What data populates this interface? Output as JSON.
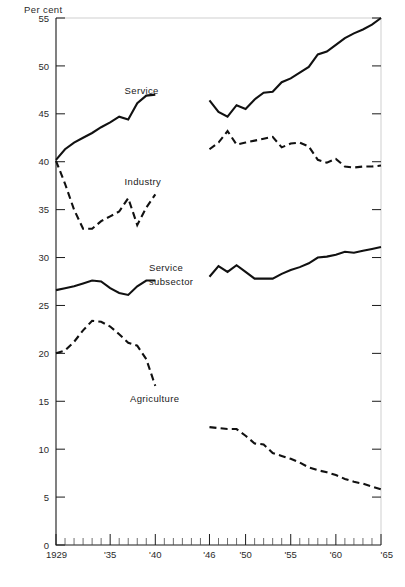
{
  "chart_data": {
    "type": "line",
    "title": "",
    "subtitle": "",
    "xlabel": "",
    "ylabel": "Per cent",
    "ylim": [
      0,
      55
    ],
    "xlim": [
      1929,
      1965
    ],
    "yticks": [
      0,
      5,
      10,
      15,
      20,
      25,
      30,
      35,
      40,
      45,
      50,
      55
    ],
    "ytick_labels": [
      "0",
      "5",
      "10",
      "15",
      "20",
      "25",
      "30",
      "35",
      "40",
      "45",
      "50",
      "55"
    ],
    "xticks": [
      1929,
      1930,
      1931,
      1932,
      1933,
      1934,
      1935,
      1936,
      1937,
      1938,
      1939,
      1940,
      1941,
      1942,
      1943,
      1944,
      1945,
      1946,
      1947,
      1948,
      1949,
      1950,
      1951,
      1952,
      1953,
      1954,
      1955,
      1956,
      1957,
      1958,
      1959,
      1960,
      1961,
      1962,
      1963,
      1964,
      1965
    ],
    "xtick_labels_shown": [
      {
        "year": 1929,
        "label": "1929"
      },
      {
        "year": 1935,
        "label": "'35"
      },
      {
        "year": 1940,
        "label": "'40"
      },
      {
        "year": 1946,
        "label": "'46"
      },
      {
        "year": 1950,
        "label": "'50"
      },
      {
        "year": 1955,
        "label": "'55"
      },
      {
        "year": 1960,
        "label": "'60"
      },
      {
        "year": 1965,
        "label": "'65"
      }
    ],
    "major_tick_years": [
      1929,
      1935,
      1940,
      1946,
      1950,
      1955,
      1960,
      1965
    ],
    "grid": false,
    "data_break": {
      "from": 1940,
      "to": 1946,
      "note": "no data plotted 1941-1945"
    },
    "series": [
      {
        "name": "Service",
        "style": "solid",
        "label_text": "Service",
        "segments": [
          {
            "x": [
              1929,
              1930,
              1931,
              1932,
              1933,
              1934,
              1935,
              1936,
              1937,
              1938,
              1939,
              1940
            ],
            "y": [
              40.2,
              41.3,
              42.0,
              42.5,
              43.0,
              43.6,
              44.1,
              44.7,
              44.4,
              46.1,
              46.9,
              47.0
            ]
          },
          {
            "x": [
              1946,
              1947,
              1948,
              1949,
              1950,
              1951,
              1952,
              1953,
              1954,
              1955,
              1956,
              1957,
              1958,
              1959,
              1960,
              1961,
              1962,
              1963,
              1964,
              1965
            ],
            "y": [
              46.4,
              45.2,
              44.7,
              45.9,
              45.5,
              46.5,
              47.2,
              47.3,
              48.3,
              48.7,
              49.3,
              49.9,
              51.2,
              51.5,
              52.2,
              52.9,
              53.4,
              53.8,
              54.3,
              55.0
            ]
          }
        ]
      },
      {
        "name": "Industry",
        "style": "dashed",
        "label_text": "Industry",
        "segments": [
          {
            "x": [
              1929,
              1930,
              1931,
              1932,
              1933,
              1934,
              1935,
              1936,
              1937,
              1938,
              1939,
              1940
            ],
            "y": [
              40.1,
              37.7,
              35.0,
              33.0,
              33.0,
              33.8,
              34.3,
              34.8,
              36.2,
              33.4,
              35.2,
              36.6
            ]
          },
          {
            "x": [
              1946,
              1947,
              1948,
              1949,
              1950,
              1951,
              1952,
              1953,
              1954,
              1955,
              1956,
              1957,
              1958,
              1959,
              1960,
              1961,
              1962,
              1963,
              1964,
              1965
            ],
            "y": [
              41.3,
              42.0,
              43.2,
              41.8,
              42.0,
              42.2,
              42.4,
              42.6,
              41.5,
              41.9,
              42.0,
              41.6,
              40.2,
              39.9,
              40.3,
              39.5,
              39.4,
              39.5,
              39.5,
              39.6
            ]
          }
        ]
      },
      {
        "name": "Service subsector",
        "style": "solid",
        "label_text": "Service subsector",
        "segments": [
          {
            "x": [
              1929,
              1930,
              1931,
              1932,
              1933,
              1934,
              1935,
              1936,
              1937,
              1938,
              1939,
              1940
            ],
            "y": [
              26.6,
              26.8,
              27.0,
              27.3,
              27.6,
              27.5,
              26.8,
              26.3,
              26.1,
              27.0,
              27.6,
              27.6
            ]
          },
          {
            "x": [
              1946,
              1947,
              1948,
              1949,
              1950,
              1951,
              1952,
              1953,
              1954,
              1955,
              1956,
              1957,
              1958,
              1959,
              1960,
              1961,
              1962,
              1963,
              1964,
              1965
            ],
            "y": [
              28.0,
              29.1,
              28.5,
              29.2,
              28.5,
              27.8,
              27.8,
              27.8,
              28.3,
              28.7,
              29.0,
              29.4,
              30.0,
              30.1,
              30.3,
              30.6,
              30.5,
              30.7,
              30.9,
              31.1
            ]
          }
        ]
      },
      {
        "name": "Agriculture",
        "style": "dashed",
        "label_text": "Agriculture",
        "segments": [
          {
            "x": [
              1929,
              1930,
              1931,
              1932,
              1933,
              1934,
              1935,
              1936,
              1937,
              1938,
              1939,
              1940
            ],
            "y": [
              20.0,
              20.3,
              21.2,
              22.4,
              23.4,
              23.3,
              22.8,
              22.0,
              21.1,
              20.8,
              19.4,
              16.6
            ]
          },
          {
            "x": [
              1946,
              1947,
              1948,
              1949,
              1950,
              1951,
              1952,
              1953,
              1954,
              1955,
              1956,
              1957,
              1958,
              1959,
              1960,
              1961,
              1962,
              1963,
              1964,
              1965
            ],
            "y": [
              12.3,
              12.2,
              12.1,
              12.1,
              11.4,
              10.6,
              10.5,
              9.6,
              9.3,
              9.0,
              8.6,
              8.1,
              7.8,
              7.6,
              7.3,
              6.9,
              6.6,
              6.4,
              6.1,
              5.8
            ]
          }
        ]
      }
    ],
    "annotations": [
      {
        "text": "Service",
        "x": 1936.6,
        "y": 47.1,
        "anchor": "start"
      },
      {
        "text": "Industry",
        "x": 1936.6,
        "y": 37.6,
        "anchor": "start"
      },
      {
        "text": "Service",
        "x": 1939.3,
        "y": 28.6,
        "anchor": "start"
      },
      {
        "text": "subsector",
        "x": 1939.3,
        "y": 27.1,
        "anchor": "start"
      },
      {
        "text": "Agriculture",
        "x": 1937.2,
        "y": 14.9,
        "anchor": "start"
      }
    ],
    "colors": {
      "line": "#111111",
      "axis": "#1a1a1a",
      "frame": "#c9c9c9",
      "text": "#2b2b2b",
      "background": "#ffffff"
    }
  }
}
